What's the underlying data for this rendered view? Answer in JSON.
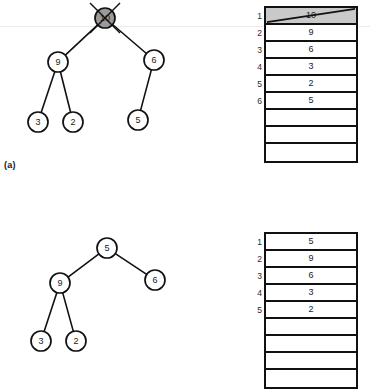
{
  "figure": {
    "type": "heap-operation-diagram",
    "colors": {
      "stroke": "#111111",
      "node_fill": "#ffffff",
      "removed_fill": "#9a9a9a",
      "shaded_cell": "#c9c9c9",
      "text": "#1a1a1a"
    }
  },
  "panels": [
    {
      "id": "a",
      "label": "(a)",
      "tree": {
        "name": "binary-tree-before",
        "nodes": [
          {
            "id": "root",
            "label": "10",
            "x": 105,
            "y": 18,
            "r": 10,
            "state": "removed",
            "struck": true
          },
          {
            "id": "n9",
            "label": "9",
            "x": 58,
            "y": 62,
            "r": 10,
            "state": "normal",
            "struck": false
          },
          {
            "id": "n6",
            "label": "6",
            "x": 154,
            "y": 60,
            "r": 10,
            "state": "normal",
            "struck": false
          },
          {
            "id": "n3",
            "label": "3",
            "x": 38,
            "y": 122,
            "r": 10,
            "state": "normal",
            "struck": false
          },
          {
            "id": "n2",
            "label": "2",
            "x": 73,
            "y": 122,
            "r": 10,
            "state": "normal",
            "struck": false
          },
          {
            "id": "n5",
            "label": "5",
            "x": 138,
            "y": 120,
            "r": 10,
            "state": "normal",
            "struck": false
          }
        ],
        "edges": [
          {
            "from": "root",
            "to": "n9"
          },
          {
            "from": "root",
            "to": "n6"
          },
          {
            "from": "n9",
            "to": "n3"
          },
          {
            "from": "n9",
            "to": "n2"
          },
          {
            "from": "n6",
            "to": "n5"
          }
        ]
      },
      "array": {
        "name": "heap-array-before",
        "x": 264,
        "y": 6,
        "width": 94,
        "rows": [
          {
            "index": "1",
            "value": "10",
            "shaded": true,
            "struck": true
          },
          {
            "index": "2",
            "value": "9",
            "shaded": false,
            "struck": false
          },
          {
            "index": "3",
            "value": "6",
            "shaded": false,
            "struck": false
          },
          {
            "index": "4",
            "value": "3",
            "shaded": false,
            "struck": false
          },
          {
            "index": "5",
            "value": "2",
            "shaded": false,
            "struck": false
          },
          {
            "index": "6",
            "value": "5",
            "shaded": false,
            "struck": false
          },
          {
            "index": "",
            "value": "",
            "shaded": false,
            "struck": false
          },
          {
            "index": "",
            "value": "",
            "shaded": false,
            "struck": false
          },
          {
            "index": "",
            "value": "",
            "shaded": false,
            "struck": false
          }
        ]
      }
    },
    {
      "id": "b",
      "label": "",
      "tree": {
        "name": "binary-tree-after",
        "nodes": [
          {
            "id": "root",
            "label": "5",
            "x": 107,
            "y": 58,
            "r": 10,
            "state": "normal",
            "struck": false
          },
          {
            "id": "n9",
            "label": "9",
            "x": 60,
            "y": 93,
            "r": 10,
            "state": "normal",
            "struck": false
          },
          {
            "id": "n6",
            "label": "6",
            "x": 155,
            "y": 90,
            "r": 10,
            "state": "normal",
            "struck": false
          },
          {
            "id": "n3",
            "label": "3",
            "x": 41,
            "y": 151,
            "r": 10,
            "state": "normal",
            "struck": false
          },
          {
            "id": "n2",
            "label": "2",
            "x": 76,
            "y": 151,
            "r": 10,
            "state": "normal",
            "struck": false
          }
        ],
        "edges": [
          {
            "from": "root",
            "to": "n9"
          },
          {
            "from": "root",
            "to": "n6"
          },
          {
            "from": "n9",
            "to": "n3"
          },
          {
            "from": "n9",
            "to": "n2"
          }
        ]
      },
      "array": {
        "name": "heap-array-after",
        "x": 264,
        "y": 42,
        "width": 94,
        "rows": [
          {
            "index": "1",
            "value": "5",
            "shaded": false,
            "struck": false
          },
          {
            "index": "2",
            "value": "9",
            "shaded": false,
            "struck": false
          },
          {
            "index": "3",
            "value": "6",
            "shaded": false,
            "struck": false
          },
          {
            "index": "4",
            "value": "3",
            "shaded": false,
            "struck": false
          },
          {
            "index": "5",
            "value": "2",
            "shaded": false,
            "struck": false
          },
          {
            "index": "",
            "value": "",
            "shaded": false,
            "struck": false
          },
          {
            "index": "",
            "value": "",
            "shaded": false,
            "struck": false
          },
          {
            "index": "",
            "value": "",
            "shaded": false,
            "struck": false
          },
          {
            "index": "",
            "value": "",
            "shaded": false,
            "struck": false
          }
        ]
      }
    }
  ]
}
